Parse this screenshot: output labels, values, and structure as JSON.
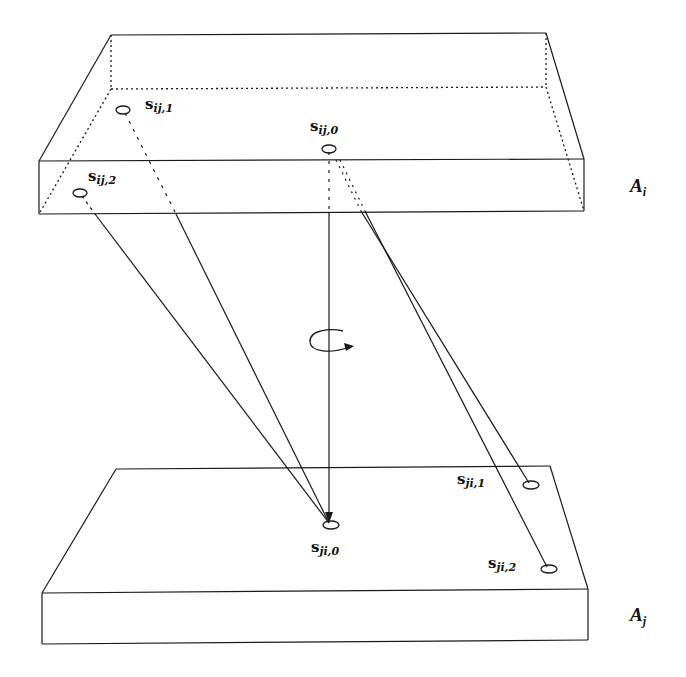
{
  "diagram": {
    "type": "3d-slabs-with-point-correspondences",
    "slabs": [
      {
        "id": "Ai",
        "label_main": "A",
        "label_sub": "i",
        "position": "top"
      },
      {
        "id": "Aj",
        "label_main": "A",
        "label_sub": "j",
        "position": "bottom"
      }
    ],
    "points": {
      "s_ij_1": {
        "main": "s",
        "sub": "ij,1"
      },
      "s_ij_0": {
        "main": "s",
        "sub": "ij,0"
      },
      "s_ij_2": {
        "main": "s",
        "sub": "ij,2"
      },
      "s_ji_0": {
        "main": "s",
        "sub": "ji,0"
      },
      "s_ji_1": {
        "main": "s",
        "sub": "ji,1"
      },
      "s_ji_2": {
        "main": "s",
        "sub": "ji,2"
      }
    },
    "connections": [
      {
        "from": "s_ij_2",
        "to": "s_ji_0"
      },
      {
        "from": "s_ij_1",
        "to": "s_ji_0"
      },
      {
        "from": "s_ij_0",
        "to": "s_ji_0",
        "arrow": true
      },
      {
        "from": "s_ij_0",
        "to": "s_ji_1"
      },
      {
        "from": "s_ij_0",
        "to": "s_ji_2"
      }
    ],
    "rotation_symbol": "rotation-arrow-about-vertical-axis",
    "line_color": "#1a1a1a"
  }
}
